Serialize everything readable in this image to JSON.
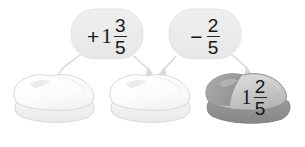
{
  "diagram": {
    "colors": {
      "background": "#ffffff",
      "bubble_fill": "#ececec",
      "bubble_stroke": "#e2e2e2",
      "blob_light_fill": "#fcfcfc",
      "blob_light_stroke": "#d8d8d8",
      "blob_light_shadow": "#ededed",
      "blob_dark_fill": "#cfcfcf",
      "blob_dark_stroke": "#8d8d8d",
      "blob_dark_shadow": "#8e8e8e",
      "arrow_color": "#d6d6d6",
      "text_color": "#161616"
    },
    "operations": [
      {
        "name": "add-one-and-three-fifths",
        "sign": "+",
        "whole": "1",
        "numerator": "3",
        "denominator": "5",
        "expression": "+1 3/5"
      },
      {
        "name": "subtract-two-fifths",
        "sign": "−",
        "whole": "",
        "numerator": "2",
        "denominator": "5",
        "expression": "− 2/5"
      }
    ],
    "blobs": [
      {
        "name": "blob-start",
        "label": "",
        "filled": false
      },
      {
        "name": "blob-middle",
        "label": "",
        "filled": false
      },
      {
        "name": "blob-result",
        "sign": "",
        "whole": "1",
        "numerator": "2",
        "denominator": "5",
        "label": "1 2/5",
        "filled": true
      }
    ],
    "arrows": [
      {
        "name": "arrow-from-op1-to-blob1",
        "from": "operation-1",
        "to": "blob-start",
        "arrowhead": false
      },
      {
        "name": "arrow-from-op1-to-blob2",
        "from": "operation-1",
        "to": "blob-middle",
        "arrowhead": true
      },
      {
        "name": "arrow-from-op2-to-blob2",
        "from": "operation-2",
        "to": "blob-middle",
        "arrowhead": true
      },
      {
        "name": "arrow-from-op2-to-blob3",
        "from": "operation-2",
        "to": "blob-result",
        "arrowhead": true
      }
    ]
  }
}
